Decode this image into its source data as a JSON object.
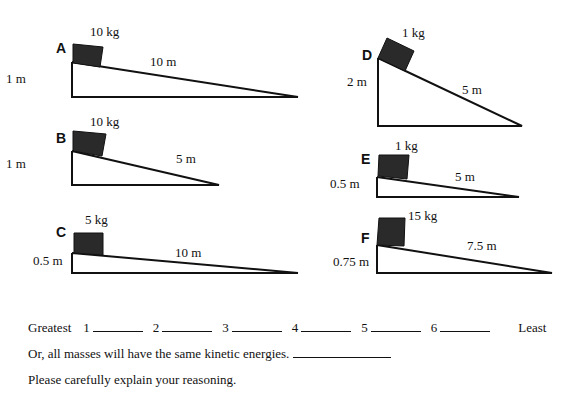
{
  "ramps": [
    {
      "id": "A",
      "label": "A",
      "mass": "10 kg",
      "height": "1 m",
      "length": "10 m"
    },
    {
      "id": "B",
      "label": "B",
      "mass": "10 kg",
      "height": "1 m",
      "length": "5 m"
    },
    {
      "id": "C",
      "label": "C",
      "mass": "5 kg",
      "height": "0.5 m",
      "length": "10 m"
    },
    {
      "id": "D",
      "label": "D",
      "mass": "1 kg",
      "height": "2 m",
      "length": "5 m"
    },
    {
      "id": "E",
      "label": "E",
      "mass": "1 kg",
      "height": "0.5 m",
      "length": "5 m"
    },
    {
      "id": "F",
      "label": "F",
      "mass": "15 kg",
      "height": "0.75 m",
      "length": "7.5 m"
    }
  ],
  "question": {
    "greatest_label": "Greatest",
    "least_label": "Least",
    "rank_numbers": [
      "1",
      "2",
      "3",
      "4",
      "5",
      "6"
    ],
    "same_option": "Or, all masses will have the same kinetic energies.",
    "explain_prompt": "Please carefully explain your reasoning."
  }
}
